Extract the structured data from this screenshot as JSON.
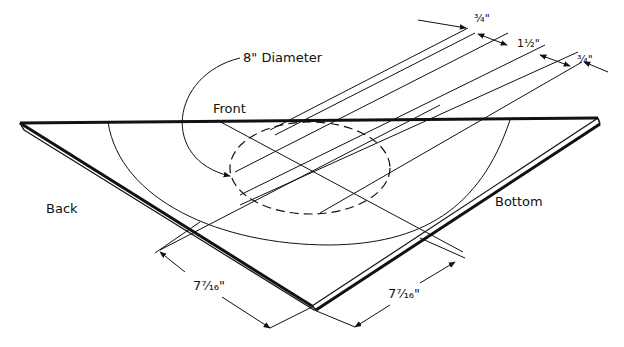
{
  "diagram": {
    "type": "isometric-technical-drawing",
    "colors": {
      "ink": "#111111",
      "paper": "#ffffff"
    },
    "labels": {
      "diameter": "8\" Diameter",
      "front": "Front",
      "back": "Back",
      "bottom": "Bottom",
      "dim_left": "7⁷⁄₁₆\"",
      "dim_right": "7⁷⁄₁₆\"",
      "dim_top_1": "³⁄₄\"",
      "dim_top_2": "1¹⁄₂\"",
      "dim_top_3": "³⁄₄\""
    }
  }
}
